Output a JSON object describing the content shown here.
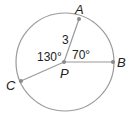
{
  "diagram": {
    "type": "circle-geometry",
    "circle": {
      "center_label": "P",
      "cx": 65,
      "cy": 62,
      "r": 49,
      "stroke": "#9a9a9a"
    },
    "points": [
      {
        "label": "A",
        "x": 79,
        "y": 19,
        "label_x": 76,
        "label_y": 14
      },
      {
        "label": "B",
        "x": 113,
        "y": 62,
        "label_x": 118,
        "label_y": 67
      },
      {
        "label": "C",
        "x": 21,
        "y": 81,
        "label_x": 6,
        "label_y": 90
      },
      {
        "label": "P",
        "x": 64,
        "y": 62,
        "label_x": 60,
        "label_y": 78
      }
    ],
    "segments": [
      {
        "from": "P",
        "to": "A",
        "length_label": "3"
      },
      {
        "from": "P",
        "to": "B"
      },
      {
        "from": "P",
        "to": "C"
      }
    ],
    "angles": [
      {
        "label": "130°",
        "between": [
          "A",
          "C"
        ]
      },
      {
        "label": "70°",
        "between": [
          "A",
          "B"
        ]
      }
    ],
    "labels": {
      "A": "A",
      "B": "B",
      "C": "C",
      "P": "P",
      "segment_pa": "3",
      "angle_apc": "130°",
      "angle_apb": "70°"
    },
    "colors": {
      "line": "#9a9a9a",
      "point": "#8a8a8a",
      "text": "#222222"
    }
  }
}
